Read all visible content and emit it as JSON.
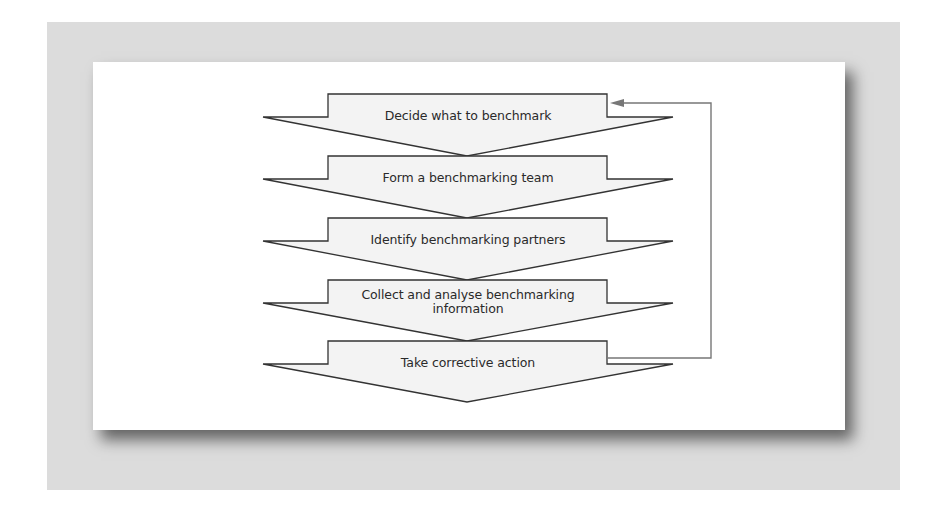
{
  "diagram": {
    "steps": [
      {
        "label": "Decide what to benchmark"
      },
      {
        "label": "Form a benchmarking team"
      },
      {
        "label": "Identify benchmarking partners"
      },
      {
        "label": "Collect and analyse benchmarking information"
      },
      {
        "label": "Take corrective action"
      }
    ],
    "feedback_loop": {
      "from_step": 5,
      "to_step": 1,
      "icon": "arrow-left-icon"
    },
    "colors": {
      "frame": "#dcdcdc",
      "panel": "#ffffff",
      "chevron_fill": "#f3f3f3",
      "chevron_stroke": "#333333",
      "feedback_line": "#777777",
      "text": "#2a2a2a"
    }
  }
}
